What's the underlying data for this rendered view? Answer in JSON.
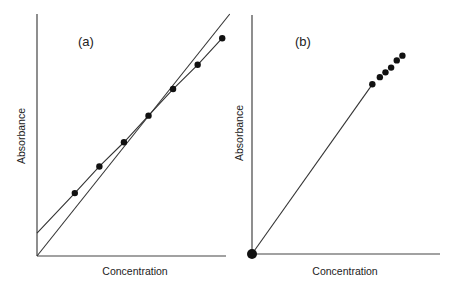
{
  "chart_data": [
    {
      "type": "line",
      "panel_label": "(a)",
      "title": "",
      "xlabel": "Concentration",
      "ylabel": "Absorbance",
      "xlim": [
        0,
        10
      ],
      "ylim": [
        0,
        10
      ],
      "grid": false,
      "ticks": false,
      "series": [
        {
          "name": "measured",
          "style": "line+markers",
          "x": [
            2.0,
            3.3,
            4.6,
            5.9,
            7.2,
            8.5,
            9.8
          ],
          "y": [
            2.6,
            3.7,
            4.7,
            5.8,
            6.9,
            7.9,
            9.0
          ],
          "line_extends_to_y_intercept": 0.95
        },
        {
          "name": "ideal",
          "style": "line",
          "x": [
            0,
            10.2
          ],
          "y": [
            0,
            10.0
          ]
        }
      ]
    },
    {
      "type": "scatter",
      "panel_label": "(b)",
      "title": "",
      "xlabel": "Concentration",
      "ylabel": "Absorbance",
      "xlim": [
        0,
        10
      ],
      "ylim": [
        0,
        10
      ],
      "grid": false,
      "ticks": false,
      "series": [
        {
          "name": "measured",
          "style": "markers",
          "x": [
            0,
            6.4,
            6.8,
            7.1,
            7.4,
            7.7,
            8.0
          ],
          "y": [
            0,
            7.1,
            7.4,
            7.6,
            7.8,
            8.1,
            8.3
          ]
        },
        {
          "name": "fit",
          "style": "line",
          "x": [
            0,
            6.4
          ],
          "y": [
            0,
            7.1
          ]
        }
      ]
    }
  ],
  "panels": {
    "a": {
      "label": "(a)",
      "xlabel": "Concentration",
      "ylabel": "Absorbance"
    },
    "b": {
      "label": "(b)",
      "xlabel": "Concentration",
      "ylabel": "Absorbance"
    }
  }
}
